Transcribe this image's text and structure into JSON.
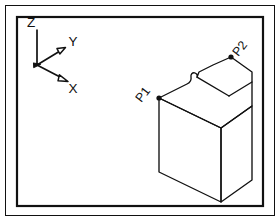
{
  "figure": {
    "kind": "isometric-technical-drawing",
    "background_color": "#ffffff",
    "line_color": "#111111",
    "frame": {
      "outer": {
        "x": 5,
        "y": 5,
        "width": 270,
        "height": 211,
        "stroke_width": 1
      },
      "inner": {
        "x": 16,
        "y": 16,
        "width": 248,
        "height": 191,
        "stroke_width": 2.2
      }
    },
    "axis_triad": {
      "name": "coordinate-axis-triad",
      "origin": {
        "x": 37,
        "y": 65
      },
      "axes": [
        {
          "id": "z",
          "label": "Z",
          "tip": {
            "x": 37,
            "y": 30
          },
          "label_pos": {
            "x": 31,
            "y": 26
          },
          "arrowhead": "none"
        },
        {
          "id": "y",
          "label": "Y",
          "tip": {
            "x": 64,
            "y": 49
          },
          "label_pos": {
            "x": 72,
            "y": 45
          },
          "arrowhead": "hollow-triangle"
        },
        {
          "id": "x",
          "label": "X",
          "tip": {
            "x": 66,
            "y": 80
          },
          "label_pos": {
            "x": 72,
            "y": 91
          },
          "arrowhead": "hollow-triangle"
        }
      ]
    },
    "solid": {
      "name": "notched-block",
      "description": "isometric rectangular block with a stepped notch and a curved relief on the top face",
      "points": [
        {
          "id": "P1",
          "label": "P1",
          "marker": {
            "x": 159,
            "y": 98
          },
          "label_pos": {
            "x": 146,
            "y": 96
          },
          "label_rotation": -52
        },
        {
          "id": "P2",
          "label": "P2",
          "marker": {
            "x": 231,
            "y": 57
          },
          "label_pos": {
            "x": 239,
            "y": 52
          },
          "label_rotation": -52
        }
      ]
    }
  }
}
